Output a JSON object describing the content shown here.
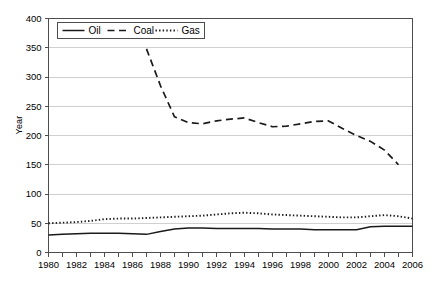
{
  "chart_data": {
    "type": "line",
    "title": "",
    "xlabel": "",
    "ylabel": "Year",
    "xlim": [
      1980,
      2006
    ],
    "ylim": [
      0,
      400
    ],
    "ytick_step": 50,
    "yticks": [
      0,
      50,
      100,
      150,
      200,
      250,
      300,
      350,
      400
    ],
    "xticks": [
      1980,
      1981,
      1982,
      1983,
      1984,
      1985,
      1986,
      1987,
      1988,
      1989,
      1990,
      1991,
      1992,
      1993,
      1994,
      1995,
      1996,
      1997,
      1998,
      1999,
      2000,
      2001,
      2002,
      2003,
      2004,
      2005,
      2006
    ],
    "xtick_labels": [
      "1980",
      "1982",
      "1984",
      "1986",
      "1988",
      "1990",
      "1992",
      "1994",
      "1996",
      "1998",
      "2000",
      "2002",
      "2004",
      "2006"
    ],
    "xtick_labels_years": [
      1980,
      1982,
      1984,
      1986,
      1988,
      1990,
      1992,
      1994,
      1996,
      1998,
      2000,
      2002,
      2004,
      2006
    ],
    "grid": "horizontal",
    "legend_position": "top-left-inside",
    "series": [
      {
        "name": "Oil",
        "style": "solid",
        "color": "#1a1a1a",
        "x": [
          1980,
          1981,
          1982,
          1983,
          1984,
          1985,
          1986,
          1987,
          1988,
          1989,
          1990,
          1991,
          1992,
          1993,
          1994,
          1995,
          1996,
          1997,
          1998,
          1999,
          2000,
          2001,
          2002,
          2003,
          2004,
          2005,
          2006
        ],
        "values": [
          30,
          31,
          32,
          33,
          33,
          33,
          32,
          31,
          36,
          40,
          42,
          42,
          41,
          41,
          41,
          41,
          40,
          40,
          40,
          39,
          39,
          39,
          39,
          44,
          45,
          45,
          45
        ]
      },
      {
        "name": "Coal",
        "style": "dashed",
        "color": "#1a1a1a",
        "x": [
          1987,
          1988,
          1989,
          1990,
          1991,
          1992,
          1993,
          1994,
          1995,
          1996,
          1997,
          1998,
          1999,
          2000,
          2001,
          2002,
          2003,
          2004,
          2005
        ],
        "values": [
          348,
          285,
          232,
          222,
          220,
          225,
          228,
          230,
          222,
          215,
          216,
          220,
          224,
          225,
          212,
          200,
          190,
          175,
          150
        ]
      },
      {
        "name": "Gas",
        "style": "dotted",
        "color": "#1a1a1a",
        "x": [
          1980,
          1981,
          1982,
          1983,
          1984,
          1985,
          1986,
          1987,
          1988,
          1989,
          1990,
          1991,
          1992,
          1993,
          1994,
          1995,
          1996,
          1997,
          1998,
          1999,
          2000,
          2001,
          2002,
          2003,
          2004,
          2005,
          2006
        ],
        "values": [
          50,
          51,
          52,
          54,
          57,
          58,
          58,
          59,
          60,
          61,
          62,
          63,
          65,
          67,
          68,
          67,
          65,
          64,
          63,
          62,
          61,
          60,
          60,
          62,
          64,
          62,
          58
        ]
      }
    ]
  },
  "legend": {
    "items": [
      {
        "label": "Oil",
        "style": "solid"
      },
      {
        "label": "Coal",
        "style": "dashed"
      },
      {
        "label": "Gas",
        "style": "dotted"
      }
    ]
  },
  "axis": {
    "y_title": "Year"
  },
  "colors": {
    "ink": "#1a1a1a",
    "grid": "#d0d0d0",
    "frame": "#4d4d4d",
    "background": "#ffffff"
  }
}
